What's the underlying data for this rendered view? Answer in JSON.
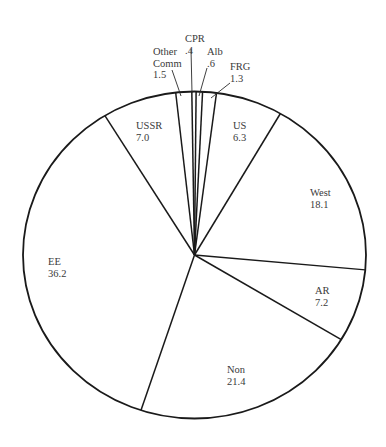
{
  "chart_data": {
    "type": "pie",
    "title": "",
    "direction": "clockwise",
    "start_angle_deg": -6.3,
    "unit": "percent",
    "total": 100.0,
    "slices": [
      {
        "label": "Other Comm",
        "label_lines": [
          "Other",
          "Comm",
          "1.5"
        ],
        "value": 1.5,
        "external_label": true
      },
      {
        "label": "CPR",
        "label_lines": [
          "CPR",
          ".4"
        ],
        "value": 0.4,
        "external_label": true
      },
      {
        "label": "Alb",
        "label_lines": [
          "Alb",
          ".6"
        ],
        "value": 0.6,
        "external_label": true
      },
      {
        "label": "FRG",
        "label_lines": [
          "FRG",
          "1.3"
        ],
        "value": 1.3,
        "external_label": true
      },
      {
        "label": "US",
        "label_lines": [
          "US",
          "6.3"
        ],
        "value": 6.3,
        "external_label": false
      },
      {
        "label": "West",
        "label_lines": [
          "West",
          "18.1"
        ],
        "value": 18.1,
        "external_label": false
      },
      {
        "label": "AR",
        "label_lines": [
          "AR",
          "7.2"
        ],
        "value": 7.2,
        "external_label": false
      },
      {
        "label": "Non",
        "label_lines": [
          "Non",
          "21.4"
        ],
        "value": 21.4,
        "external_label": false
      },
      {
        "label": "EE",
        "label_lines": [
          "EE",
          "36.2"
        ],
        "value": 36.2,
        "external_label": false
      },
      {
        "label": "USSR",
        "label_lines": [
          "USSR",
          "7.0"
        ],
        "value": 7.0,
        "external_label": false
      }
    ],
    "legend": "none",
    "colors": {
      "fill": "#ffffff",
      "stroke": "#1a1a1a",
      "text": "#3a3a3a"
    }
  },
  "layout": {
    "cx": 194.5,
    "cy": 255,
    "rx": 171.5,
    "ry": 163.5,
    "label_positions": [
      {
        "x": 153,
        "y": 55,
        "anchor": "start",
        "leader": [
          172,
          70,
          181,
          96
        ]
      },
      {
        "x": 185,
        "y": 42,
        "anchor": "start",
        "leader": [
          191,
          49,
          192,
          93
        ]
      },
      {
        "x": 207,
        "y": 55,
        "anchor": "start",
        "leader": [
          207,
          68,
          199,
          96
        ]
      },
      {
        "x": 230,
        "y": 70,
        "anchor": "start",
        "leader": [
          230,
          83,
          211,
          98
        ]
      },
      {
        "x": 233,
        "y": 129,
        "anchor": "start"
      },
      {
        "x": 310,
        "y": 196,
        "anchor": "start"
      },
      {
        "x": 315,
        "y": 294,
        "anchor": "start"
      },
      {
        "x": 227,
        "y": 373,
        "anchor": "start"
      },
      {
        "x": 48,
        "y": 265,
        "anchor": "start"
      },
      {
        "x": 136,
        "y": 129,
        "anchor": "start"
      }
    ]
  }
}
